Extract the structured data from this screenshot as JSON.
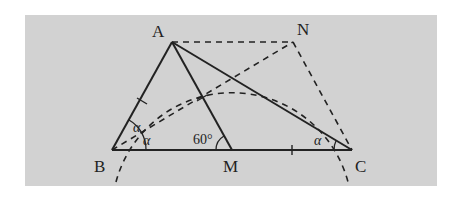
{
  "diagram": {
    "points": {
      "A": {
        "label": "A",
        "x": 172,
        "y": 42
      },
      "B": {
        "label": "B",
        "x": 112,
        "y": 150
      },
      "M": {
        "label": "M",
        "x": 232,
        "y": 150
      },
      "C": {
        "label": "C",
        "x": 352,
        "y": 150
      },
      "N": {
        "label": "N",
        "x": 293,
        "y": 42
      }
    },
    "angles": {
      "B_upper": "α",
      "B_lower": "α",
      "C": "α",
      "M": "60°"
    },
    "segments_solid": [
      "AB",
      "AM",
      "AC",
      "BC"
    ],
    "segments_dashed": [
      "AN",
      "BN",
      "NC"
    ],
    "arc": {
      "center": "M",
      "radius": 120,
      "style": "dashed"
    },
    "colors": {
      "background": "#d2d2d2",
      "stroke": "#222222"
    }
  }
}
